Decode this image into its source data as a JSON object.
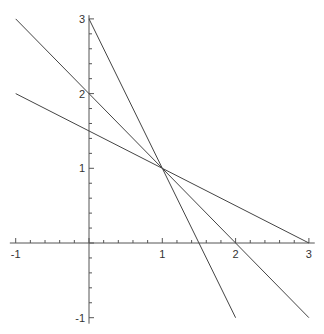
{
  "chart_data": {
    "type": "line",
    "title": "",
    "xlabel": "",
    "ylabel": "",
    "xlim": [
      -1,
      3
    ],
    "ylim": [
      -1,
      3
    ],
    "grid": false,
    "legend": null,
    "x_ticks": [
      -1,
      1,
      2,
      3
    ],
    "x_tick_labels": [
      "-1",
      "1",
      "2",
      "3"
    ],
    "y_ticks": [
      -1,
      1,
      2,
      3
    ],
    "y_tick_labels": [
      "-1",
      "1",
      "2",
      "3"
    ],
    "minor_tick_step": 0.2,
    "series": [
      {
        "name": "y = 3 - 2x",
        "x": [
          0,
          2
        ],
        "y": [
          3,
          -1
        ]
      },
      {
        "name": "y = 2 - x",
        "x": [
          -1,
          3
        ],
        "y": [
          3,
          -1
        ]
      },
      {
        "name": "y = 1.5 - 0.5x",
        "x": [
          -1,
          3
        ],
        "y": [
          2,
          0
        ]
      }
    ],
    "line_color": "#444444",
    "axis_color": "#555555"
  }
}
